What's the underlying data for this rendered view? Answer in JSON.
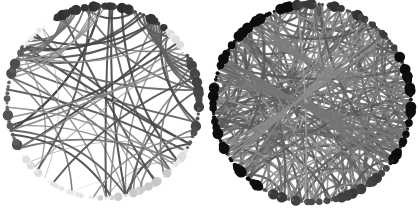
{
  "figure": {
    "width": 418,
    "height": 208,
    "background_color": "#ffffff",
    "panel_count": 2
  },
  "panels": [
    {
      "id": "left-network",
      "name": "Left circular network graph",
      "label": "",
      "layout": "circular",
      "center_x": 103,
      "center_y": 102,
      "radius": 96,
      "node_count": 150,
      "edge_count": 62,
      "density": "sparse",
      "node_color_min": "#f2f2f2",
      "node_color_max": "#1c1c1c",
      "edge_color_min": "#ededed",
      "edge_color_max": "#4a4a4a",
      "node_radius_min": 0.9,
      "node_radius_max": 5.2,
      "edge_width_min": 0.45,
      "edge_width_max": 2.4,
      "seed": 1274,
      "dark_sectors": [
        {
          "start_deg": 238,
          "end_deg": 310,
          "intensity": 0.95
        },
        {
          "start_deg": 150,
          "end_deg": 215,
          "intensity": 0.78
        },
        {
          "start_deg": 330,
          "end_deg": 30,
          "intensity": 0.85
        },
        {
          "start_deg": 45,
          "end_deg": 100,
          "intensity": 0.12
        }
      ],
      "edge_bundles": [
        {
          "from_deg": 300,
          "to_deg": 345,
          "count": 6,
          "weight": 0.9
        },
        {
          "from_deg": 250,
          "to_deg": 212,
          "count": 5,
          "weight": 0.8
        },
        {
          "from_deg": 268,
          "to_deg": 200,
          "count": 4,
          "weight": 0.55
        }
      ]
    },
    {
      "id": "right-network",
      "name": "Right circular network graph",
      "label": "",
      "layout": "circular",
      "center_x": 106,
      "center_y": 103,
      "radius": 99,
      "node_count": 160,
      "edge_count": 230,
      "density": "dense",
      "node_color_min": "#cfcfcf",
      "node_color_max": "#1a1a1a",
      "edge_color_min": "#d8d8d8",
      "edge_color_max": "#5a5a5a",
      "node_radius_min": 1.0,
      "node_radius_max": 5.4,
      "edge_width_min": 0.5,
      "edge_width_max": 2.6,
      "seed": 9931,
      "dark_sectors": [
        {
          "start_deg": 120,
          "end_deg": 260,
          "intensity": 0.92
        },
        {
          "start_deg": 330,
          "end_deg": 40,
          "intensity": 0.88
        },
        {
          "start_deg": 260,
          "end_deg": 330,
          "intensity": 0.6
        },
        {
          "start_deg": 40,
          "end_deg": 120,
          "intensity": 0.55
        }
      ],
      "edge_bundles": [
        {
          "from_deg": 200,
          "to_deg": 30,
          "count": 7,
          "weight": 0.85
        },
        {
          "from_deg": 235,
          "to_deg": 355,
          "count": 6,
          "weight": 0.8
        },
        {
          "from_deg": 150,
          "to_deg": 310,
          "count": 5,
          "weight": 0.7
        }
      ]
    }
  ],
  "chart_data": {
    "type": "scatter",
    "xlabel": "",
    "ylabel": "",
    "grid": false,
    "legend": "none",
    "series": [
      {
        "name": "left-network",
        "nodes": 150,
        "edges": 62,
        "mean_node_radius": 2.1,
        "edge_density_pct": 0.6,
        "node_shade_range": [
          0.05,
          0.95
        ],
        "edge_shade_range": [
          0.07,
          0.72
        ],
        "description": "Sparse graph: light gray long-range arcs, node shade fades from dark at lower-left/top to near-white at the right rim."
      },
      {
        "name": "right-network",
        "nodes": 160,
        "edges": 230,
        "mean_node_radius": 2.4,
        "edge_density_pct": 1.8,
        "node_shade_range": [
          0.2,
          0.9
        ],
        "edge_shade_range": [
          0.15,
          0.65
        ],
        "description": "Dense graph: heavily overlapping medium-gray arcs filling the disc interior, uniformly dark nodes around the full rim."
      }
    ]
  }
}
